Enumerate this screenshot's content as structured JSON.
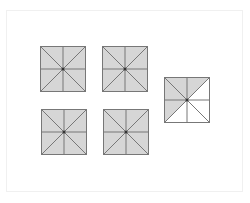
{
  "diagram": {
    "colors": {
      "shade": "#d6d6d6",
      "unshaded": "#ffffff",
      "line": "#777777",
      "center_dot": "#333333",
      "frame": "#f0f0f0"
    },
    "triangle_order": [
      "top-left",
      "top-right",
      "right-top",
      "right-bottom",
      "bottom-right",
      "bottom-left",
      "left-bottom",
      "left-top"
    ],
    "squares": [
      {
        "id": "square-1",
        "x": 40,
        "y": 46,
        "shaded": [
          true,
          true,
          true,
          true,
          true,
          true,
          true,
          true
        ]
      },
      {
        "id": "square-2",
        "x": 102,
        "y": 46,
        "shaded": [
          true,
          true,
          true,
          true,
          true,
          true,
          true,
          true
        ]
      },
      {
        "id": "square-3",
        "x": 41,
        "y": 109,
        "shaded": [
          true,
          true,
          true,
          true,
          true,
          true,
          true,
          true
        ]
      },
      {
        "id": "square-4",
        "x": 103,
        "y": 109,
        "shaded": [
          true,
          true,
          true,
          true,
          true,
          true,
          true,
          true
        ]
      },
      {
        "id": "square-5",
        "x": 164,
        "y": 77,
        "shaded": [
          true,
          true,
          false,
          false,
          false,
          false,
          true,
          true
        ]
      }
    ]
  }
}
